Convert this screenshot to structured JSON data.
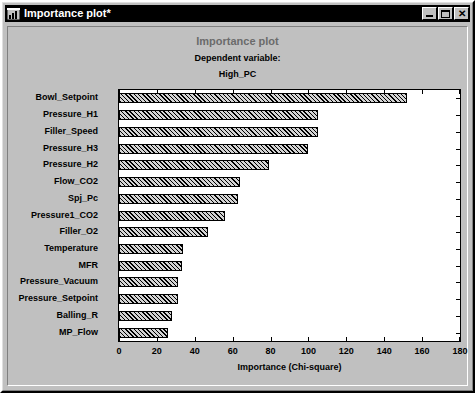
{
  "window": {
    "title": "Importance plot*",
    "icon": "chart-window-icon",
    "buttons": {
      "minimize": "_",
      "maximize": "□",
      "close": "✕"
    }
  },
  "chart_data": {
    "type": "bar",
    "orientation": "horizontal",
    "title": "Importance plot",
    "subtitle_line1": "Dependent variable:",
    "subtitle_line2": "High_PC",
    "xlabel": "Importance (Chi-square)",
    "ylabel": "",
    "xlim": [
      0,
      180
    ],
    "xticks": [
      0,
      20,
      40,
      60,
      80,
      100,
      120,
      140,
      160,
      180
    ],
    "grid": false,
    "legend": null,
    "categories": [
      "Bowl_Setpoint",
      "Pressure_H1",
      "Filler_Speed",
      "Pressure_H3",
      "Pressure_H2",
      "Flow_CO2",
      "Spj_Pc",
      "Pressure1_CO2",
      "Filler_O2",
      "Temperature",
      "MFR",
      "Pressure_Vacuum",
      "Pressure_Setpoint",
      "Balling_R",
      "MP_Flow"
    ],
    "values": [
      152,
      105,
      105,
      100,
      79,
      64,
      63,
      56,
      47,
      34,
      33,
      31,
      31,
      28,
      26
    ],
    "bar_fill": "#d4d4d4",
    "bar_pattern": "diagonal-hatch",
    "bar_border": "#000000",
    "plot_background": "#ffffff",
    "window_background": "#c0c0c0",
    "title_color": "#6b6b6b"
  }
}
